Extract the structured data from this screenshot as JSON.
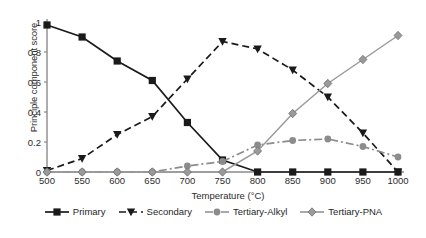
{
  "chart_data": {
    "type": "line",
    "title": "",
    "xlabel": "Temperature (°C)",
    "ylabel": "Principle component score",
    "x": [
      500,
      550,
      600,
      650,
      700,
      750,
      800,
      850,
      900,
      950,
      1000
    ],
    "xlim": [
      500,
      1000
    ],
    "ylim": [
      0,
      1
    ],
    "yticks": [
      "0",
      "0.2",
      "0.4",
      "0.6",
      "0.8",
      "1"
    ],
    "ytick_values": [
      0,
      0.2,
      0.4,
      0.6,
      0.8,
      1
    ],
    "xticks": [
      "500",
      "550",
      "600",
      "650",
      "700",
      "750",
      "800",
      "850",
      "900",
      "950",
      "1000"
    ],
    "grid": false,
    "legend_position": "bottom",
    "series": [
      {
        "name": "Primary",
        "color": "#1a1a1a",
        "marker": "square",
        "linestyle": "solid",
        "values": [
          0.98,
          0.9,
          0.74,
          0.61,
          0.33,
          0.08,
          0.0,
          0.0,
          0.0,
          0.0,
          0.0
        ]
      },
      {
        "name": "Secondary",
        "color": "#1a1a1a",
        "marker": "triangle",
        "linestyle": "dashed",
        "values": [
          0.01,
          0.09,
          0.25,
          0.37,
          0.62,
          0.87,
          0.82,
          0.68,
          0.5,
          0.26,
          0.0
        ]
      },
      {
        "name": "Tertiary-Alkyl",
        "color": "#8c8c8c",
        "marker": "circle",
        "linestyle": "dashdot",
        "values": [
          0.0,
          0.0,
          0.0,
          0.0,
          0.04,
          0.07,
          0.18,
          0.21,
          0.22,
          0.17,
          0.1
        ]
      },
      {
        "name": "Tertiary-PNA",
        "color": "#9a9a9a",
        "marker": "diamond",
        "linestyle": "solid",
        "values": [
          0.0,
          0.0,
          0.0,
          0.0,
          0.0,
          0.0,
          0.14,
          0.39,
          0.59,
          0.75,
          0.91
        ]
      }
    ]
  },
  "legend": {
    "items": [
      {
        "label": "Primary"
      },
      {
        "label": "Secondary"
      },
      {
        "label": "Tertiary-Alkyl"
      },
      {
        "label": "Tertiary-PNA"
      }
    ]
  }
}
